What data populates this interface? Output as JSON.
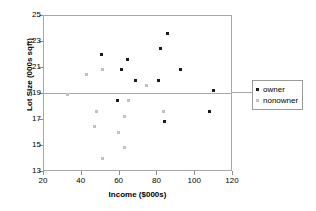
{
  "chart_data": {
    "type": "scatter",
    "title": "",
    "xlabel": "Income ($000s)",
    "ylabel": "Lot Size (000s sqft)",
    "xlim": [
      20,
      120
    ],
    "ylim": [
      13,
      25
    ],
    "xticks": [
      20,
      40,
      60,
      80,
      100,
      120
    ],
    "yticks": [
      13,
      15,
      17,
      19,
      21,
      23,
      25
    ],
    "grid": false,
    "reference_lines": [
      {
        "axis": "y",
        "value": 19
      }
    ],
    "legend_position": "right",
    "series": [
      {
        "name": "owner",
        "color": "#1a1a1a",
        "points": [
          {
            "x": 51.0,
            "y": 22.0
          },
          {
            "x": 61.5,
            "y": 20.8
          },
          {
            "x": 64.8,
            "y": 21.6
          },
          {
            "x": 69.0,
            "y": 20.0
          },
          {
            "x": 81.0,
            "y": 20.0
          },
          {
            "x": 82.0,
            "y": 22.4
          },
          {
            "x": 86.0,
            "y": 23.6
          },
          {
            "x": 93.0,
            "y": 20.8
          },
          {
            "x": 110.0,
            "y": 19.2
          },
          {
            "x": 108.0,
            "y": 17.6
          },
          {
            "x": 84.5,
            "y": 16.8
          },
          {
            "x": 59.5,
            "y": 18.4
          }
        ]
      },
      {
        "name": "nonowner",
        "color": "#c2c2c2",
        "points": [
          {
            "x": 33.0,
            "y": 18.9
          },
          {
            "x": 43.0,
            "y": 20.4
          },
          {
            "x": 51.5,
            "y": 20.8
          },
          {
            "x": 75.0,
            "y": 19.6
          },
          {
            "x": 65.0,
            "y": 18.4
          },
          {
            "x": 84.0,
            "y": 17.6
          },
          {
            "x": 48.5,
            "y": 17.6
          },
          {
            "x": 63.0,
            "y": 17.2
          },
          {
            "x": 47.5,
            "y": 16.4
          },
          {
            "x": 60.0,
            "y": 16.0
          },
          {
            "x": 63.0,
            "y": 14.8
          },
          {
            "x": 51.5,
            "y": 14.0
          }
        ]
      }
    ]
  },
  "legend": {
    "entries": [
      {
        "label": "owner",
        "color": "#1a1a1a"
      },
      {
        "label": "nonowner",
        "color": "#c2c2c2"
      }
    ]
  }
}
